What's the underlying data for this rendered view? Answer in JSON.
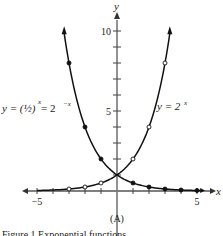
{
  "chart_data": {
    "type": "line",
    "title": "",
    "caption": "(A)",
    "footer_text": "Figure 1  Exponential functions",
    "xlabel": "x",
    "ylabel": "y",
    "xlim": [
      -5.3,
      5.6
    ],
    "ylim": [
      0,
      11
    ],
    "x_ticks": [
      -5,
      -4,
      -3,
      -2,
      -1,
      1,
      2,
      3,
      4,
      5
    ],
    "x_tick_labels": {
      "-5": "−5",
      "5": "5"
    },
    "y_ticks": [
      1,
      2,
      3,
      4,
      5,
      6,
      7,
      8,
      9,
      10
    ],
    "y_tick_labels": {
      "5": "5",
      "10": "10"
    },
    "grid": false,
    "series": [
      {
        "name": "y = 2^x",
        "label_text": "y = 2",
        "label_sup": "x",
        "marker": "open-circle",
        "x": [
          -3,
          -2,
          -1,
          0,
          1,
          2,
          3
        ],
        "y": [
          0.125,
          0.25,
          0.5,
          1,
          2,
          4,
          8
        ],
        "curve_range": [
          -5,
          3.3
        ]
      },
      {
        "name": "y = (1/2)^x = 2^-x",
        "label_text": "y = (½)",
        "label_mid": " = 2",
        "label_sup": "x",
        "label_sup2": "−x",
        "marker": "filled-circle",
        "x": [
          -3,
          -2,
          -1,
          0,
          1,
          2,
          3,
          4,
          5
        ],
        "y": [
          8,
          4,
          2,
          1,
          0.5,
          0.25,
          0.125,
          0.0625,
          0.03125
        ],
        "curve_range": [
          -3.3,
          5.3
        ]
      }
    ]
  }
}
